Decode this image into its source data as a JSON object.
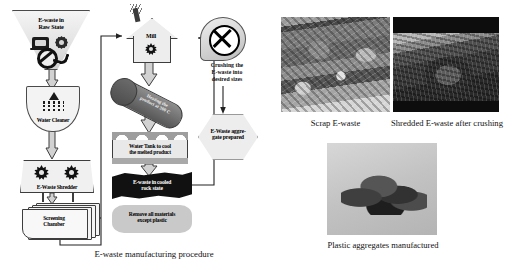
{
  "figure": {
    "caption_left": "E-waste manufacturing procedure"
  },
  "flow": {
    "nodes": [
      {
        "id": "raw",
        "label": "E-waste in\nRaw State",
        "shape": "funnel"
      },
      {
        "id": "cleaner",
        "label": "Water Cleaner",
        "shape": "shield"
      },
      {
        "id": "shredder",
        "label": "E-Waste Shredder",
        "shape": "trapezoid"
      },
      {
        "id": "screen",
        "label": "Screening\nChamber",
        "shape": "stacked-card"
      },
      {
        "id": "mill",
        "label": "Mill",
        "shape": "house"
      },
      {
        "id": "heat",
        "label": "Heating the\nproduct at 300 C",
        "shape": "tube"
      },
      {
        "id": "tank",
        "label": "Water Tank to cool\nthe melted product",
        "shape": "tank"
      },
      {
        "id": "rock",
        "label": "E-waste in cooled\nrock state",
        "shape": "rock"
      },
      {
        "id": "remove",
        "label": "Remove all materials\nexcept plastic",
        "shape": "rounded"
      },
      {
        "id": "crusher",
        "label": "Crushing the\nE-waste into\ndesired sizes",
        "shape": "circle-x"
      },
      {
        "id": "prepared",
        "label": "E-Waste aggre-\ngate prepared",
        "shape": "hexagon"
      }
    ],
    "icons": [
      "tv-icon",
      "gear-icon",
      "prohibition-icon",
      "phone-icon",
      "shower-icon",
      "water-drops-icon",
      "star-blade-icon",
      "chimney-smoke-icon",
      "crusher-x-icon"
    ]
  },
  "photos": [
    {
      "id": "photo-scrap",
      "caption": "Scrap E-waste"
    },
    {
      "id": "photo-shredded",
      "caption": "Shredded E-waste after crushing"
    },
    {
      "id": "photo-plastic",
      "caption": "Plastic aggregates manufactured"
    }
  ],
  "labels": {
    "raw_line1": "E-waste in",
    "raw_line2": "Raw State",
    "cleaner": "Water Cleaner",
    "shredder": "E-Waste Shredder",
    "screen_line1": "Screening",
    "screen_line2": "Chamber",
    "mill": "Mill",
    "heat_line1": "Heating the",
    "heat_line2": "product at 300 C",
    "tank_line1": "Water Tank to cool",
    "tank_line2": "the melted product",
    "rock_line1": "E-waste in cooled",
    "rock_line2": "rock state",
    "remove_line1": "Remove all materials",
    "remove_line2": "except plastic",
    "crusher_line1": "Crushing the",
    "crusher_line2": "E-waste into",
    "crusher_line3": "desired sizes",
    "prepared_line1": "E-Waste aggre-",
    "prepared_line2": "gate prepared"
  },
  "colors": {
    "page_bg": "#ffffff",
    "node_fill": "#f0f0f0",
    "node_stroke": "#3d3d3d",
    "arrow_fill": "#d2d2d2",
    "dark_node": "#111111",
    "text": "#000000"
  }
}
